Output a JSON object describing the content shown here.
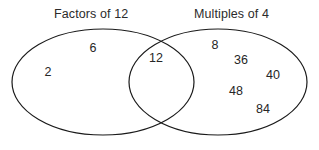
{
  "diagram": {
    "type": "venn",
    "title": "",
    "background_color": "#ffffff",
    "outline_color": "#1a1a1a",
    "text_color": "#2b2b2b",
    "sets": [
      {
        "id": "left",
        "label": "Factors of 12",
        "label_x": 54,
        "label_y": 7,
        "ellipse": {
          "cx": 103,
          "cy": 82,
          "rx": 91,
          "ry": 53
        }
      },
      {
        "id": "right",
        "label": "Multiples of 4",
        "label_x": 194,
        "label_y": 7,
        "ellipse": {
          "cx": 218,
          "cy": 82,
          "rx": 89,
          "ry": 53
        }
      }
    ],
    "members": [
      {
        "value": "6",
        "region": "left-only",
        "x": 93,
        "y": 48
      },
      {
        "value": "2",
        "region": "left-only",
        "x": 48,
        "y": 72
      },
      {
        "value": "12",
        "region": "intersection",
        "x": 156,
        "y": 58
      },
      {
        "value": "8",
        "region": "right-only",
        "x": 215,
        "y": 45
      },
      {
        "value": "36",
        "region": "right-only",
        "x": 241,
        "y": 60
      },
      {
        "value": "40",
        "region": "right-only",
        "x": 273,
        "y": 75
      },
      {
        "value": "48",
        "region": "right-only",
        "x": 236,
        "y": 91
      },
      {
        "value": "84",
        "region": "right-only",
        "x": 263,
        "y": 109
      }
    ]
  }
}
